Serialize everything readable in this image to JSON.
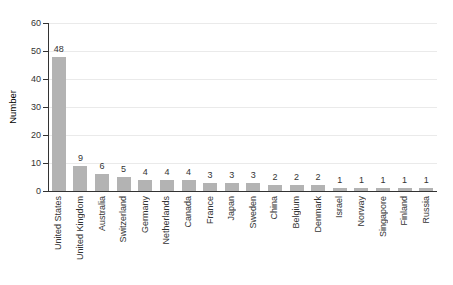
{
  "chart_data": {
    "type": "bar",
    "ylabel": "Number",
    "xlabel": "",
    "categories": [
      "United States",
      "United Kingdom",
      "Australia",
      "Switzerland",
      "Germany",
      "Netherlands",
      "Canada",
      "France",
      "Japan",
      "Sweden",
      "China",
      "Belgium",
      "Denmark",
      "Israel",
      "Norway",
      "Singapore",
      "Finland",
      "Russia"
    ],
    "values": [
      48,
      9,
      6,
      5,
      4,
      4,
      4,
      3,
      3,
      3,
      2,
      2,
      2,
      1,
      1,
      1,
      1,
      1
    ],
    "yticks": [
      0,
      10,
      20,
      30,
      40,
      50,
      60
    ],
    "ylim": [
      0,
      60
    ],
    "grid": "horizontal",
    "legend": "none",
    "colors": {
      "bar": "#b3b3b3",
      "axis": "#333333",
      "grid": "#eaeaea",
      "text": "#333333",
      "background": "#ffffff"
    }
  }
}
